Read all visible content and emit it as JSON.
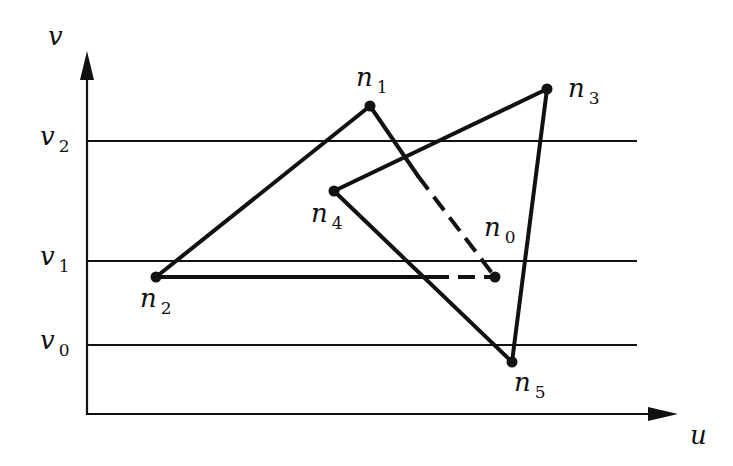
{
  "axes": {
    "v_label": "v",
    "u_label": "u"
  },
  "scanlines": [
    {
      "name": "v",
      "sub": "2",
      "y": 141
    },
    {
      "name": "v",
      "sub": "1",
      "y": 261
    },
    {
      "name": "v",
      "sub": "0",
      "y": 345
    }
  ],
  "nodes": [
    {
      "id": "n1",
      "name": "n",
      "sub": "1",
      "x": 370,
      "y": 106,
      "lx": 356,
      "ly": 86
    },
    {
      "id": "n2",
      "name": "n",
      "sub": "2",
      "x": 156,
      "y": 277,
      "lx": 140,
      "ly": 307
    },
    {
      "id": "n3",
      "name": "n",
      "sub": "3",
      "x": 547,
      "y": 89,
      "lx": 568,
      "ly": 97
    },
    {
      "id": "n4",
      "name": "n",
      "sub": "4",
      "x": 334,
      "y": 191,
      "lx": 311,
      "ly": 222
    },
    {
      "id": "n0",
      "name": "n",
      "sub": "0",
      "x": 495,
      "y": 277,
      "lx": 484,
      "ly": 236
    },
    {
      "id": "n5",
      "name": "n",
      "sub": "5",
      "x": 512,
      "y": 362,
      "lx": 514,
      "ly": 391
    }
  ],
  "edges": [
    {
      "from": "n2",
      "to": "n1",
      "style": "solid"
    },
    {
      "from": "n1",
      "to": "n0",
      "style": "partial-dashed",
      "dash_start": [
        418,
        176
      ]
    },
    {
      "from": "n2",
      "to": "n0",
      "style": "partial-dashed",
      "dash_start": [
        432,
        277
      ]
    },
    {
      "from": "n4",
      "to": "n3",
      "style": "solid"
    },
    {
      "from": "n3",
      "to": "n5",
      "style": "solid"
    },
    {
      "from": "n4",
      "to": "n5",
      "style": "solid"
    }
  ]
}
